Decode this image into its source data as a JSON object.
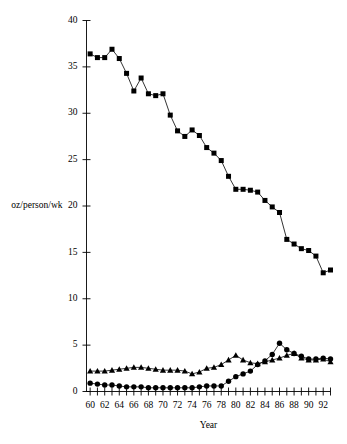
{
  "chart_data": {
    "type": "line",
    "title": "",
    "xlabel": "Year",
    "ylabel": "oz/person/wk",
    "xlim": [
      59.5,
      93.0
    ],
    "ylim": [
      0,
      40
    ],
    "grid": false,
    "legend_position": "none",
    "y_ticks": [
      0,
      5,
      10,
      15,
      20,
      25,
      30,
      35,
      40
    ],
    "y_tick_labels": [
      "0",
      "5",
      "10",
      "15",
      "20",
      "25",
      "30",
      "35",
      "40"
    ],
    "x_ticks": [
      60,
      61,
      62,
      63,
      64,
      65,
      66,
      67,
      68,
      69,
      70,
      71,
      72,
      73,
      74,
      75,
      76,
      77,
      78,
      79,
      80,
      81,
      82,
      83,
      84,
      85,
      86,
      87,
      88,
      89,
      90,
      91,
      92,
      93
    ],
    "x_tick_labels": [
      "60",
      "62",
      "64",
      "66",
      "68",
      "70",
      "72",
      "74",
      "76",
      "78",
      "80",
      "82",
      "84",
      "86",
      "88",
      "90",
      "92"
    ],
    "x_labeled_ticks": [
      60,
      62,
      64,
      66,
      68,
      70,
      72,
      74,
      76,
      78,
      80,
      82,
      84,
      86,
      88,
      90,
      92
    ],
    "x": [
      60,
      61,
      62,
      63,
      64,
      65,
      66,
      67,
      68,
      69,
      70,
      71,
      72,
      73,
      74,
      75,
      76,
      77,
      78,
      79,
      80,
      81,
      82,
      83,
      84,
      85,
      86,
      87,
      88,
      89,
      90,
      91,
      92,
      93
    ],
    "series": [
      {
        "name": "whole milk",
        "marker": "square",
        "values": [
          36.4,
          36.0,
          36.0,
          36.9,
          35.9,
          34.3,
          32.4,
          33.8,
          32.1,
          31.9,
          32.1,
          29.8,
          28.1,
          27.5,
          28.2,
          27.6,
          26.3,
          25.7,
          24.9,
          23.2,
          21.8,
          21.8,
          21.7,
          21.5,
          20.6,
          19.9,
          19.3,
          16.4,
          15.9,
          15.4,
          15.2,
          14.6,
          12.8,
          13.1
        ]
      },
      {
        "name": "lowfat milk",
        "marker": "triangle",
        "values": [
          2.2,
          2.2,
          2.2,
          2.3,
          2.4,
          2.5,
          2.6,
          2.6,
          2.5,
          2.4,
          2.3,
          2.3,
          2.3,
          2.2,
          1.9,
          2.1,
          2.5,
          2.6,
          2.9,
          3.4,
          3.9,
          3.4,
          3.1,
          3.0,
          3.2,
          3.4,
          3.6,
          3.9,
          4.1,
          3.6,
          3.4,
          3.4,
          3.5,
          3.2
        ]
      },
      {
        "name": "skim milk",
        "marker": "circle",
        "values": [
          0.9,
          0.8,
          0.7,
          0.7,
          0.6,
          0.5,
          0.5,
          0.5,
          0.4,
          0.4,
          0.4,
          0.4,
          0.4,
          0.4,
          0.4,
          0.5,
          0.6,
          0.6,
          0.6,
          1.1,
          1.6,
          1.9,
          2.2,
          2.9,
          3.3,
          4.0,
          5.2,
          4.5,
          4.1,
          3.8,
          3.5,
          3.5,
          3.6,
          3.5
        ]
      }
    ]
  }
}
